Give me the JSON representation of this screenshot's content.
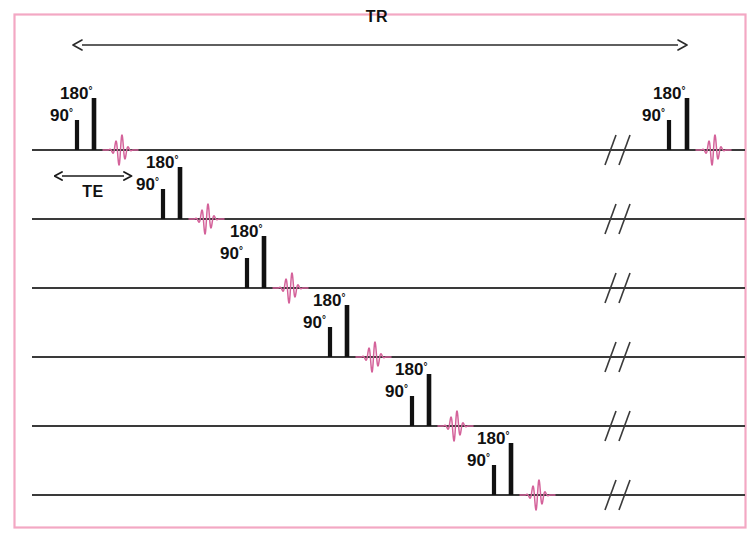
{
  "figure": {
    "type": "mri-pulse-sequence-timing-diagram",
    "title_visible": false,
    "frame_color": "#f3a8c4",
    "baseline_color": "#3a3a3a",
    "pulse_color": "#111111",
    "echo_color": "#d4629a",
    "background": "#ffffff"
  },
  "timing_labels": {
    "tr": {
      "text": "TR",
      "arrow": "double-headed-horizontal",
      "x_start": 82,
      "x_end": 678,
      "y": 45,
      "label_x": 377,
      "label_y": 22
    },
    "te": {
      "text": "TE",
      "arrow": "double-headed-horizontal",
      "x_start": 62,
      "x_end": 124,
      "y": 176,
      "label_x": 93,
      "label_y": 197
    }
  },
  "pulse_labels": {
    "rf90": "90",
    "rf180": "180",
    "degree": "°"
  },
  "break_mark": {
    "name": "time-axis-break",
    "glyph": "//"
  },
  "rows": [
    {
      "index": 1,
      "baseline_y": 150,
      "line_x_start": 32,
      "line_x_end": 745,
      "break_x": 610,
      "events": [
        {
          "kind": "rf90",
          "x": 77,
          "height": 30,
          "label": "90",
          "label_x": 50,
          "label_y": 121
        },
        {
          "kind": "rf180",
          "x": 94,
          "height": 52,
          "label": "180",
          "label_x": 60,
          "label_y": 99
        },
        {
          "kind": "echo",
          "x": 103,
          "width": 35
        }
      ],
      "repeat_events": [
        {
          "kind": "rf90",
          "x": 669,
          "height": 30,
          "label": "90",
          "label_x": 642,
          "label_y": 121
        },
        {
          "kind": "rf180",
          "x": 687,
          "height": 52,
          "label": "180",
          "label_x": 653,
          "label_y": 99
        },
        {
          "kind": "echo",
          "x": 696,
          "width": 35
        }
      ]
    },
    {
      "index": 2,
      "baseline_y": 219,
      "line_x_start": 32,
      "line_x_end": 745,
      "break_x": 610,
      "events": [
        {
          "kind": "rf90",
          "x": 163,
          "height": 30,
          "label": "90",
          "label_x": 136,
          "label_y": 190
        },
        {
          "kind": "rf180",
          "x": 180,
          "height": 52,
          "label": "180",
          "label_x": 146,
          "label_y": 168
        },
        {
          "kind": "echo",
          "x": 189,
          "width": 35
        }
      ],
      "repeat_events": []
    },
    {
      "index": 3,
      "baseline_y": 288,
      "line_x_start": 32,
      "line_x_end": 745,
      "break_x": 610,
      "events": [
        {
          "kind": "rf90",
          "x": 247,
          "height": 30,
          "label": "90",
          "label_x": 220,
          "label_y": 259
        },
        {
          "kind": "rf180",
          "x": 264,
          "height": 52,
          "label": "180",
          "label_x": 230,
          "label_y": 237
        },
        {
          "kind": "echo",
          "x": 273,
          "width": 35
        }
      ],
      "repeat_events": []
    },
    {
      "index": 4,
      "baseline_y": 357,
      "line_x_start": 32,
      "line_x_end": 745,
      "break_x": 610,
      "events": [
        {
          "kind": "rf90",
          "x": 330,
          "height": 30,
          "label": "90",
          "label_x": 303,
          "label_y": 328
        },
        {
          "kind": "rf180",
          "x": 347,
          "height": 52,
          "label": "180",
          "label_x": 313,
          "label_y": 306
        },
        {
          "kind": "echo",
          "x": 356,
          "width": 35
        }
      ],
      "repeat_events": []
    },
    {
      "index": 5,
      "baseline_y": 426,
      "line_x_start": 32,
      "line_x_end": 745,
      "break_x": 610,
      "events": [
        {
          "kind": "rf90",
          "x": 412,
          "height": 30,
          "label": "90",
          "label_x": 385,
          "label_y": 397
        },
        {
          "kind": "rf180",
          "x": 429,
          "height": 52,
          "label": "180",
          "label_x": 395,
          "label_y": 375
        },
        {
          "kind": "echo",
          "x": 438,
          "width": 35
        }
      ],
      "repeat_events": []
    },
    {
      "index": 6,
      "baseline_y": 495,
      "line_x_start": 32,
      "line_x_end": 745,
      "break_x": 610,
      "events": [
        {
          "kind": "rf90",
          "x": 494,
          "height": 30,
          "label": "90",
          "label_x": 467,
          "label_y": 466
        },
        {
          "kind": "rf180",
          "x": 511,
          "height": 52,
          "label": "180",
          "label_x": 477,
          "label_y": 444
        },
        {
          "kind": "echo",
          "x": 520,
          "width": 35
        }
      ],
      "repeat_events": []
    }
  ]
}
